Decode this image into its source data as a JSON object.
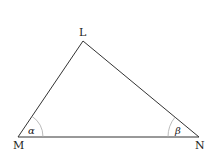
{
  "diagram": {
    "type": "triangle",
    "vertices": [
      {
        "name": "L",
        "x": 83,
        "y": 41
      },
      {
        "name": "M",
        "x": 18,
        "y": 137
      },
      {
        "name": "N",
        "x": 199,
        "y": 137
      }
    ],
    "vertex_labels": {
      "L": "L",
      "M": "M",
      "N": "N"
    },
    "angle_labels": {
      "at_M": "α",
      "at_N": "β"
    },
    "colors": {
      "line": "#333333",
      "arc": "#aaaaaa",
      "text": "#222222"
    }
  }
}
